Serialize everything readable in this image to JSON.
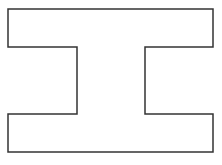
{
  "diagram": {
    "shape": "i-beam-outline",
    "stroke_color": "#333333",
    "fill_color": "#ffffff",
    "background": "#ffffff",
    "stroke_width": 1.5,
    "points": "8,9 213,9 213,47 145,47 145,114 213,114 213,152 8,152 8,114 77,114 77,47 8,47"
  }
}
